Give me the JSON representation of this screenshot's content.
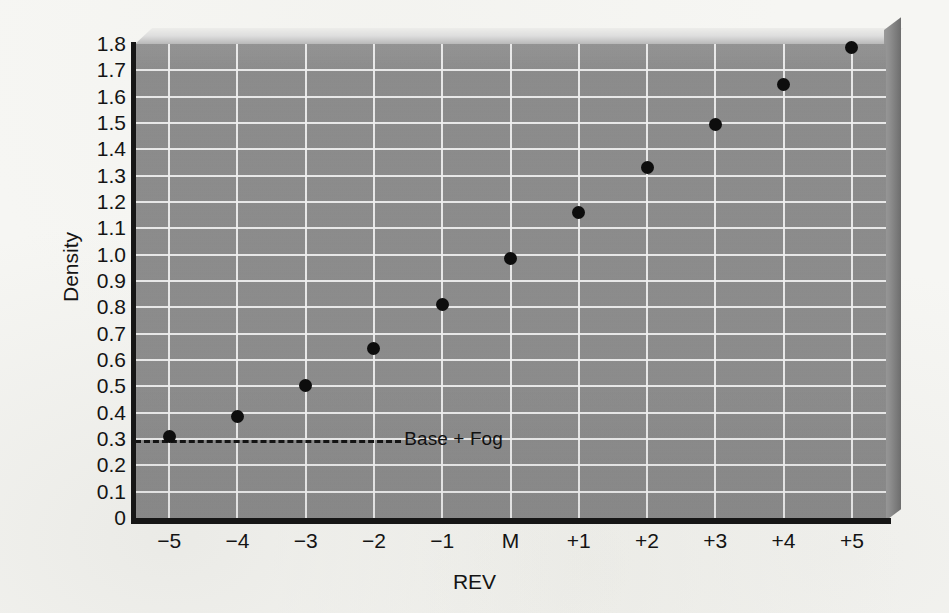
{
  "chart_data": {
    "type": "scatter",
    "title": "",
    "xlabel": "REV",
    "ylabel": "Density",
    "categories": [
      "−5",
      "−4",
      "−3",
      "−2",
      "−1",
      "M",
      "+1",
      "+2",
      "+3",
      "+4",
      "+5"
    ],
    "x": [
      -5,
      -4,
      -3,
      -2,
      -1,
      0,
      1,
      2,
      3,
      4,
      5
    ],
    "values": [
      0.31,
      0.385,
      0.505,
      0.645,
      0.81,
      0.985,
      1.16,
      1.33,
      1.495,
      1.645,
      1.785
    ],
    "series": [
      {
        "name": "Density",
        "values": [
          0.31,
          0.385,
          0.505,
          0.645,
          0.81,
          0.985,
          1.16,
          1.33,
          1.495,
          1.645,
          1.785
        ]
      }
    ],
    "ylim": [
      0,
      1.8
    ],
    "xlim": [
      -5.5,
      5.5
    ],
    "ytick_labels": [
      "1.8",
      "1.7",
      "1.6",
      "1.5",
      "1.4",
      "1.3",
      "1.2",
      "1.1",
      "1.0",
      "0.9",
      "0.8",
      "0.7",
      "0.6",
      "0.5",
      "0.4",
      "0.3",
      "0.2",
      "0.1",
      "0"
    ],
    "ytick_values": [
      1.8,
      1.7,
      1.6,
      1.5,
      1.4,
      1.3,
      1.2,
      1.1,
      1.0,
      0.9,
      0.8,
      0.7,
      0.6,
      0.5,
      0.4,
      0.3,
      0.2,
      0.1,
      0
    ],
    "grid": true,
    "legend_position": "none",
    "annotations": [
      {
        "name": "base-fog",
        "label": "Base + Fog",
        "type": "hline-dashed",
        "y": 0.295,
        "x_start": -5.5,
        "x_end": -1.6
      }
    ],
    "colors": {
      "plot_background": "#8c8c8c",
      "gridline": "#f2f2f2",
      "axis": "#161616",
      "marker": "#0d0d0d",
      "page_background": "#f6f6f3"
    }
  }
}
